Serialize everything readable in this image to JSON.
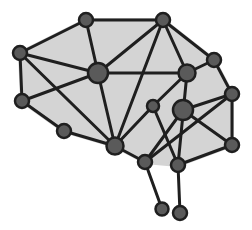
{
  "figure": {
    "colors": {
      "background": "#ffffff",
      "fill": "#d4d4d4",
      "edge": "#1f1f1f",
      "node": "#5a5a5a",
      "node_stroke": "#1f1f1f"
    },
    "nodes": [
      {
        "id": "A",
        "label": "top-left-node",
        "size": "medium"
      },
      {
        "id": "B",
        "label": "top-right-node",
        "size": "medium"
      },
      {
        "id": "C",
        "label": "left-upper-node",
        "size": "medium"
      },
      {
        "id": "D",
        "label": "center-hub-node",
        "size": "large"
      },
      {
        "id": "E",
        "label": "right-hub-node",
        "size": "medium-large"
      },
      {
        "id": "F",
        "label": "upper-right-edge-node",
        "size": "medium"
      },
      {
        "id": "G",
        "label": "left-lower-node",
        "size": "medium"
      },
      {
        "id": "H",
        "label": "right-edge-node",
        "size": "medium"
      },
      {
        "id": "I",
        "label": "inner-small-node",
        "size": "small"
      },
      {
        "id": "J",
        "label": "right-inner-hub-node",
        "size": "large"
      },
      {
        "id": "K",
        "label": "bottom-left-node",
        "size": "medium"
      },
      {
        "id": "L",
        "label": "bottom-hub-node",
        "size": "medium-large"
      },
      {
        "id": "M",
        "label": "bottom-right-node",
        "size": "medium"
      },
      {
        "id": "N",
        "label": "stem-left-node",
        "size": "medium"
      },
      {
        "id": "O",
        "label": "stem-right-node",
        "size": "medium"
      },
      {
        "id": "P",
        "label": "stem-left-end-node",
        "size": "small-medium"
      },
      {
        "id": "Q",
        "label": "stem-right-end-node",
        "size": "medium"
      }
    ],
    "edges": [
      [
        "A",
        "B"
      ],
      [
        "A",
        "C"
      ],
      [
        "A",
        "D"
      ],
      [
        "B",
        "D"
      ],
      [
        "B",
        "E"
      ],
      [
        "B",
        "F"
      ],
      [
        "B",
        "L"
      ],
      [
        "C",
        "D"
      ],
      [
        "C",
        "G"
      ],
      [
        "C",
        "L"
      ],
      [
        "D",
        "E"
      ],
      [
        "D",
        "G"
      ],
      [
        "D",
        "L"
      ],
      [
        "E",
        "F"
      ],
      [
        "E",
        "I"
      ],
      [
        "E",
        "O"
      ],
      [
        "F",
        "H"
      ],
      [
        "G",
        "K"
      ],
      [
        "H",
        "J"
      ],
      [
        "H",
        "M"
      ],
      [
        "H",
        "N"
      ],
      [
        "I",
        "L"
      ],
      [
        "I",
        "O"
      ],
      [
        "J",
        "M"
      ],
      [
        "J",
        "N"
      ],
      [
        "K",
        "L"
      ],
      [
        "L",
        "N"
      ],
      [
        "N",
        "P"
      ],
      [
        "O",
        "M"
      ],
      [
        "O",
        "Q"
      ]
    ],
    "outline": [
      "A",
      "B",
      "F",
      "H",
      "M",
      "O",
      "N",
      "L",
      "K",
      "G",
      "C"
    ]
  }
}
